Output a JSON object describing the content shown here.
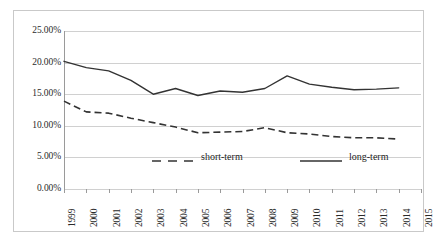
{
  "chart_data": {
    "type": "line",
    "title": "",
    "subtitle": "",
    "xlabel": "",
    "ylabel": "",
    "grid": true,
    "legend_position": "inside-bottom",
    "x": [
      1999,
      2000,
      2001,
      2002,
      2003,
      2004,
      2005,
      2006,
      2007,
      2008,
      2009,
      2010,
      2011,
      2012,
      2013,
      2014,
      2015
    ],
    "xtick_labels": [
      "1999",
      "2000",
      "2001",
      "2002",
      "2003",
      "2004",
      "2005",
      "2006",
      "2007",
      "2008",
      "2009",
      "2010",
      "2011",
      "2012",
      "2013",
      "2014",
      "2015"
    ],
    "xlim": [
      1999,
      2015
    ],
    "ylim": [
      0,
      25
    ],
    "ytick_labels": [
      "0.00%",
      "5.00%",
      "10.00%",
      "15.00%",
      "20.00%",
      "25.00%"
    ],
    "ytick_values": [
      0,
      5,
      10,
      15,
      20,
      25
    ],
    "y_unit": "%",
    "series": [
      {
        "name": "short-term",
        "style": "dashed",
        "color": "#333333",
        "x": [
          1999,
          2000,
          2001,
          2002,
          2003,
          2004,
          2005,
          2006,
          2007,
          2008,
          2009,
          2010,
          2011,
          2012,
          2013,
          2014
        ],
        "values": [
          13.9,
          12.2,
          12.0,
          11.2,
          10.5,
          9.8,
          8.9,
          9.0,
          9.1,
          9.7,
          8.9,
          8.7,
          8.3,
          8.1,
          8.1,
          7.9
        ]
      },
      {
        "name": "long-term",
        "style": "solid",
        "color": "#333333",
        "x": [
          1999,
          2000,
          2001,
          2002,
          2003,
          2004,
          2005,
          2006,
          2007,
          2008,
          2009,
          2010,
          2011,
          2012,
          2013,
          2014
        ],
        "values": [
          20.2,
          19.2,
          18.7,
          17.2,
          15.0,
          15.9,
          14.8,
          15.5,
          15.3,
          15.9,
          17.9,
          16.6,
          16.1,
          15.7,
          15.8,
          16.0
        ]
      }
    ]
  },
  "legend": {
    "entries": [
      {
        "label": "short-term",
        "style": "dashed"
      },
      {
        "label": "long-term",
        "style": "solid"
      }
    ]
  }
}
